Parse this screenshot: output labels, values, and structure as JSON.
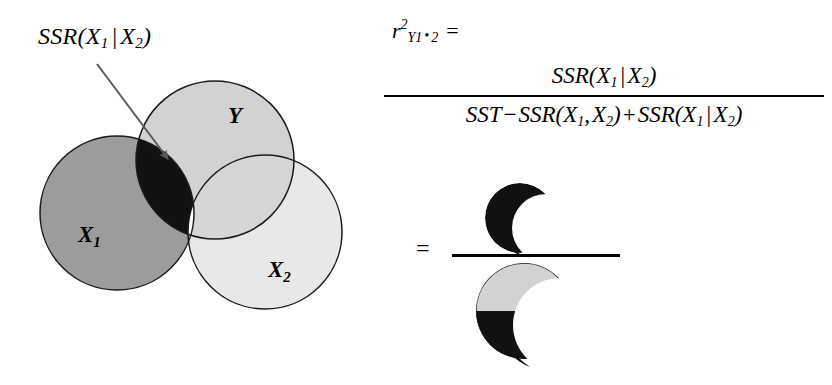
{
  "figure": {
    "type": "venn-diagram-with-formula",
    "background_color": "#ffffff"
  },
  "venn": {
    "callout": {
      "text_full": "SSR(X1 | X2)",
      "prefix": "SSR",
      "open_paren": "(",
      "var1": "X",
      "var1_sub": "1",
      "separator": "|",
      "var2": "X",
      "var2_sub": "2",
      "close_paren": ")"
    },
    "arrow": {
      "points_to": "black-lens-region",
      "color": "#555555"
    },
    "circles": [
      {
        "id": "Y",
        "label": "Y",
        "label_sub": "",
        "fill": "#d2d2d2",
        "stroke": "#1a1a1a",
        "cx": 215,
        "cy": 160,
        "r": 79
      },
      {
        "id": "X1",
        "label": "X",
        "label_sub": "1",
        "fill": "#9c9c9c",
        "stroke": "#1a1a1a",
        "cx": 117,
        "cy": 213,
        "r": 77
      },
      {
        "id": "X2",
        "label": "X",
        "label_sub": "2",
        "fill": "#e8e8e8",
        "stroke": "#1a1a1a",
        "cx": 265,
        "cy": 232,
        "r": 77
      }
    ],
    "regions": [
      {
        "id": "X1-and-Y-minus-X2",
        "meaning": "SSR(X1 | X2)",
        "fill": "#111111"
      },
      {
        "id": "X1-and-X2-and-Y",
        "meaning": "triple-overlap",
        "fill": "#ffffff"
      }
    ]
  },
  "formula": {
    "lhs": {
      "symbol": "r",
      "superscript": "2",
      "subscript": "Y1",
      "dot": "•",
      "subscript2": "2",
      "equals": "="
    },
    "numerator": {
      "text_full": "SSR(X1 | X2)",
      "prefix": "SSR",
      "open_paren": "(",
      "var1": "X",
      "var1_sub": "1",
      "separator": "|",
      "var2": "X",
      "var2_sub": "2",
      "close_paren": ")"
    },
    "denominator": {
      "text_full": "SST - SSR(X1, X2) + SSR(X1 | X2)",
      "term1": "SST",
      "op1": "−",
      "term2_prefix": "SSR",
      "term2_open": "(",
      "term2_v1": "X",
      "term2_v1_sub": "1",
      "term2_comma": ",",
      "term2_v2": "X",
      "term2_v2_sub": "2",
      "term2_close": ")",
      "op2": "+",
      "term3_prefix": "SSR",
      "term3_open": "(",
      "term3_v1": "X",
      "term3_v1_sub": "1",
      "term3_sep": "|",
      "term3_v2": "X",
      "term3_v2_sub": "2",
      "term3_close": ")"
    }
  },
  "pictorial": {
    "equals": "=",
    "numerator_shape": {
      "id": "crescent-black",
      "description": "black crescent representing SSR(X1 | X2)",
      "fill": "#111111"
    },
    "denominator_shape": {
      "id": "crescent-two-tone",
      "description": "crescent with light gray upper portion and black lower portion",
      "fill_top": "#d2d2d2",
      "fill_bottom": "#111111",
      "stroke": "#1a1a1a"
    }
  }
}
